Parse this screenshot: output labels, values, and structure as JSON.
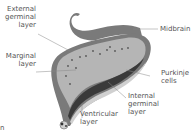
{
  "labels": {
    "external_germinal_layer": [
      "External",
      "germinal",
      "layer"
    ],
    "marginal_layer": [
      "Marginal",
      "layer"
    ],
    "midbrain": [
      "Midbrain"
    ],
    "purkinje_cells": [
      "Purkinje",
      "cells"
    ],
    "internal_germinal_layer": [
      "Internal",
      "germinal",
      "layer"
    ],
    "ventricular_layer": [
      "Ventricular",
      "layer"
    ],
    "edge_fragment": [
      "n"
    ]
  },
  "colors": {
    "outer_tissue": "#7a7a7a",
    "marginal_fill": "#b5b5b5",
    "inner_dark_band": "#3a3a3a",
    "cell_dots": "#555555",
    "leader_lines": "#888888",
    "label_text": "#555555"
  }
}
